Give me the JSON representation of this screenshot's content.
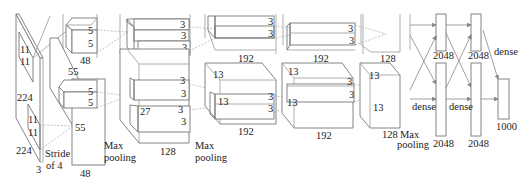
{
  "diagram": {
    "input": {
      "width": "224",
      "height": "224",
      "depth": "3",
      "kernel_top": "11",
      "kernel_top2": "11",
      "kernel_bot": "11",
      "kernel_bot2": "11",
      "stride_line1": "Stride",
      "stride_line2": "of 4"
    },
    "conv1": {
      "size": "55",
      "size2": "55",
      "depth_top": "48",
      "depth_bot": "48",
      "kernel_top": "5",
      "kernel_top2": "5",
      "kernel_bot": "5",
      "kernel_bot2": "5",
      "pool_line1": "Max",
      "pool_line2": "pooling"
    },
    "conv2": {
      "size_top": "27",
      "size_bot": "27",
      "depth_top": "128",
      "depth_bot": "128",
      "k1": "3",
      "k2": "3",
      "k3": "3",
      "k4": "3",
      "k5": "3",
      "k6": "3",
      "pool_line1": "Max",
      "pool_line2": "pooling"
    },
    "conv3": {
      "size": "13",
      "size2": "13",
      "depth_top": "192",
      "depth_bot": "192",
      "k1": "3",
      "k2": "3",
      "k3": "3",
      "k4": "3"
    },
    "conv4": {
      "size": "13",
      "size2": "13",
      "depth_top": "192",
      "depth_bot": "192",
      "k1": "3",
      "k2": "3",
      "k3": "3",
      "k4": "3"
    },
    "conv5": {
      "size": "13",
      "size2": "13",
      "depth_top": "128",
      "depth_bot": "128",
      "pool_line1": "Max",
      "pool_line2": "pooling"
    },
    "fc6": {
      "top": "2048",
      "bot": "2048",
      "label": "dense"
    },
    "fc7": {
      "top": "2048",
      "bot": "2048",
      "label": "dense"
    },
    "fc8": {
      "out": "1000",
      "label": "dense"
    },
    "colors": {
      "stroke": "#777777",
      "dashed": "#aaaaaa",
      "text": "#222222",
      "background": "#ffffff"
    }
  }
}
